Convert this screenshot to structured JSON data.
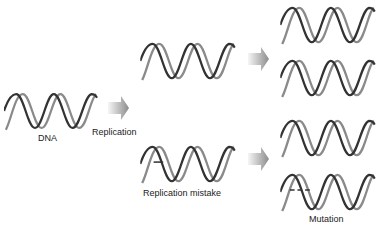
{
  "diagram": {
    "labels": {
      "dna": "DNA",
      "replication": "Replication",
      "replication_mistake": "Replication mistake",
      "mutation": "Mutation"
    },
    "nodes": [
      {
        "id": "dna",
        "type": "double-helix",
        "label": "DNA",
        "mark": "none"
      },
      {
        "id": "copy-correct",
        "type": "double-helix",
        "label": "",
        "mark": "none"
      },
      {
        "id": "copy-mistake",
        "type": "double-helix",
        "label": "Replication mistake",
        "mark": "single-tick"
      },
      {
        "id": "result-1",
        "type": "double-helix",
        "label": "",
        "mark": "none"
      },
      {
        "id": "result-2",
        "type": "double-helix",
        "label": "",
        "mark": "none"
      },
      {
        "id": "result-3",
        "type": "double-helix",
        "label": "",
        "mark": "none"
      },
      {
        "id": "result-4",
        "type": "double-helix",
        "label": "Mutation",
        "mark": "double-tick"
      }
    ],
    "edges": [
      {
        "from": "dna",
        "to": "copy-correct",
        "label": "Replication"
      },
      {
        "from": "dna",
        "to": "copy-mistake",
        "label": "Replication"
      },
      {
        "from": "copy-correct",
        "to": "result-1",
        "label": ""
      },
      {
        "from": "copy-correct",
        "to": "result-2",
        "label": ""
      },
      {
        "from": "copy-mistake",
        "to": "result-3",
        "label": ""
      },
      {
        "from": "copy-mistake",
        "to": "result-4",
        "label": ""
      }
    ],
    "colors": {
      "strand_dark": "#333333",
      "strand_light": "#8a8a8a",
      "arrow_start": "#f4f4f4",
      "arrow_end": "#8c8c8c",
      "text": "#222222"
    }
  }
}
